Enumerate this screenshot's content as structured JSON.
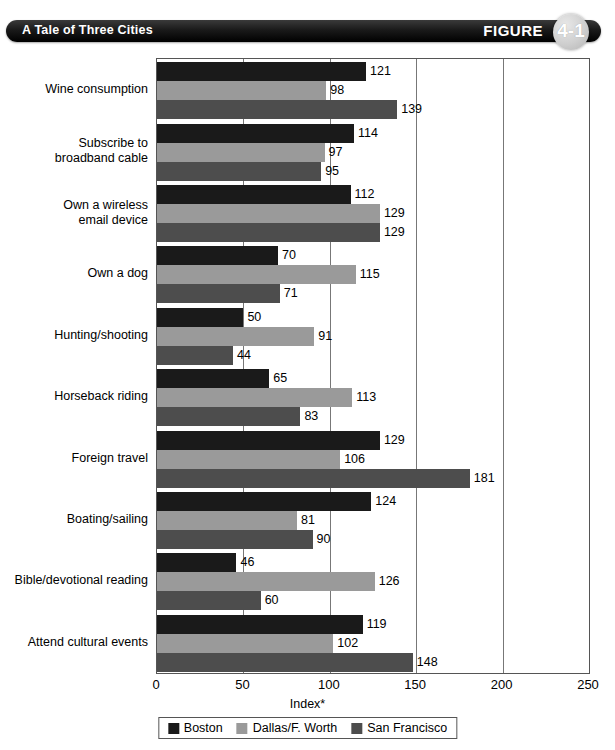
{
  "header": {
    "title": "A Tale of Three Cities",
    "figure_word": "FIGURE",
    "figure_number": "4-1"
  },
  "chart_data": {
    "type": "bar",
    "orientation": "horizontal",
    "title": "A Tale of Three Cities",
    "xlabel": "Index*",
    "ylabel": "",
    "xlim": [
      0,
      250
    ],
    "xticks": [
      0,
      50,
      100,
      150,
      200,
      250
    ],
    "grid": true,
    "legend_position": "bottom",
    "categories": [
      "Wine consumption",
      "Subscribe to\nbroadband cable",
      "Own a wireless\nemail device",
      "Own a dog",
      "Hunting/shooting",
      "Horseback riding",
      "Foreign travel",
      "Boating/sailing",
      "Bible/devotional reading",
      "Attend cultural events"
    ],
    "series": [
      {
        "name": "Boston",
        "color": "#1a1a1a",
        "values": [
          121,
          114,
          112,
          70,
          50,
          65,
          129,
          124,
          46,
          119
        ]
      },
      {
        "name": "Dallas/F. Worth",
        "color": "#9a9a9a",
        "values": [
          98,
          97,
          129,
          115,
          91,
          113,
          106,
          81,
          126,
          102
        ]
      },
      {
        "name": "San Francisco",
        "color": "#4d4d4d",
        "values": [
          139,
          95,
          129,
          71,
          44,
          83,
          181,
          90,
          60,
          148
        ]
      }
    ]
  }
}
